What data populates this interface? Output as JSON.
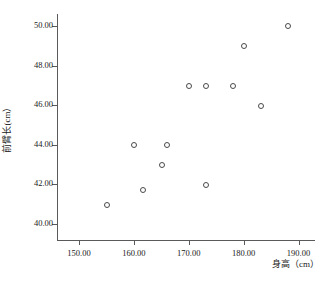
{
  "chart_data": {
    "type": "scatter",
    "title": "",
    "xlabel": "身高（cm）",
    "ylabel": "前臂长(cm）",
    "xlim": [
      146,
      193
    ],
    "ylim": [
      39.2,
      50.6
    ],
    "grid": false,
    "legend": null,
    "x_ticks": [
      "150.00",
      "160.00",
      "170.00",
      "180.00",
      "190.00"
    ],
    "x_tick_values": [
      150,
      160,
      170,
      180,
      190
    ],
    "y_ticks": [
      "40.00",
      "42.00",
      "44.00",
      "46.00",
      "48.00",
      "50.00"
    ],
    "y_tick_values": [
      40,
      42,
      44,
      46,
      48,
      50
    ],
    "marker": "open-circle",
    "marker_color": "#4a4a4a",
    "x": [
      155,
      160,
      161.5,
      165,
      166,
      170,
      173,
      173,
      178,
      180,
      183,
      188
    ],
    "y": [
      41,
      44,
      41.75,
      43,
      44,
      47,
      47,
      42,
      47,
      49,
      46,
      50
    ],
    "points": [
      {
        "x": 155,
        "y": 41
      },
      {
        "x": 160,
        "y": 44
      },
      {
        "x": 161.5,
        "y": 41.75
      },
      {
        "x": 165,
        "y": 43
      },
      {
        "x": 166,
        "y": 44
      },
      {
        "x": 170,
        "y": 47
      },
      {
        "x": 173,
        "y": 47
      },
      {
        "x": 173,
        "y": 42
      },
      {
        "x": 178,
        "y": 47
      },
      {
        "x": 180,
        "y": 49
      },
      {
        "x": 183,
        "y": 46
      },
      {
        "x": 188,
        "y": 50
      }
    ]
  }
}
